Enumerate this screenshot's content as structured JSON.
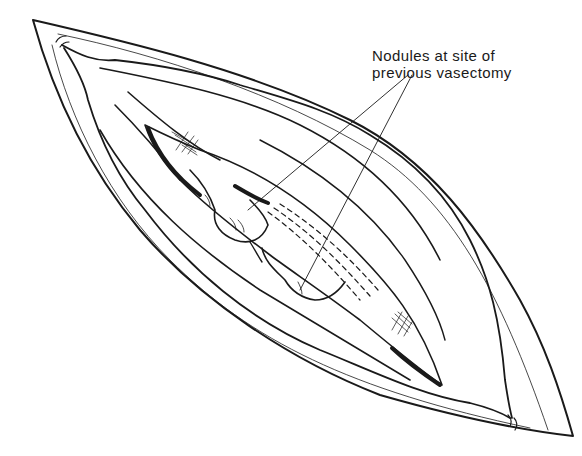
{
  "figure": {
    "annotation": {
      "line1": "Nodules at site of",
      "line2": "previous vasectomy",
      "pointer_count": 2
    },
    "colors": {
      "ink": "#1a1a1a",
      "background": "#ffffff"
    }
  }
}
